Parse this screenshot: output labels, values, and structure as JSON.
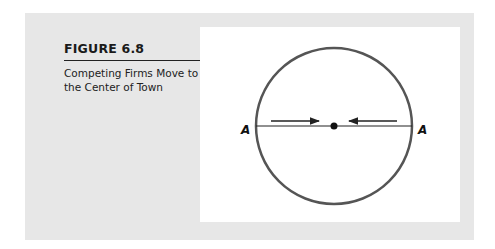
{
  "figure": {
    "label": "FIGURE 6.8",
    "title": "Competing Firms Move to the Center of Town"
  },
  "diagram": {
    "left_endpoint_label": "A",
    "right_endpoint_label": "A",
    "elements": [
      "circle (town)",
      "diameter line A–A",
      "center point",
      "arrow pointing right toward center",
      "arrow pointing left toward center"
    ]
  },
  "colors": {
    "panel_bg": "#e7e7e7",
    "figure_bg": "#ffffff",
    "circle_stroke": "#555555",
    "line": "#222222"
  }
}
